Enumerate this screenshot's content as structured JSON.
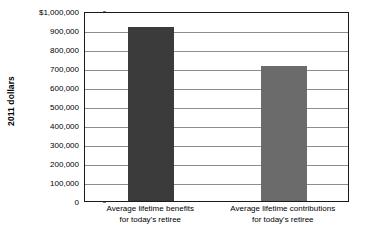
{
  "chart_data": {
    "type": "bar",
    "title": "",
    "subtitle": "",
    "xlabel": "",
    "ylabel": "2011 dollars",
    "ylim": [
      0,
      1000000
    ],
    "grid": true,
    "legend": null,
    "categories": [
      "Average lifetime benefits for today's retiree",
      "Average lifetime contributions for today's retiree"
    ],
    "category_lines": [
      [
        "Average lifetime benefits",
        "for today's retiree"
      ],
      [
        "Average lifetime contributions",
        "for today's retiree"
      ]
    ],
    "values": [
      915000,
      712000
    ],
    "value_labels": [
      "",
      ""
    ],
    "bar_colors": [
      "#3b3b3b",
      "#6b6b6b"
    ],
    "ytick_values": [
      1000000,
      900000,
      800000,
      700000,
      600000,
      500000,
      400000,
      300000,
      200000,
      100000,
      0
    ],
    "ytick_labels": [
      "$1,000,000",
      "900,000",
      "800,000",
      "700,000",
      "600,000",
      "500,000",
      "400,000",
      "300,000",
      "200,000",
      "100,000",
      "0"
    ]
  },
  "axis": {
    "y_title": "2011 dollars"
  },
  "colors": {
    "bar_benefits": "#3b3b3b",
    "bar_contributions": "#6b6b6b",
    "gridline": "#8c8c8c",
    "axis_border": "#1a1a1a",
    "background": "#ffffff"
  }
}
